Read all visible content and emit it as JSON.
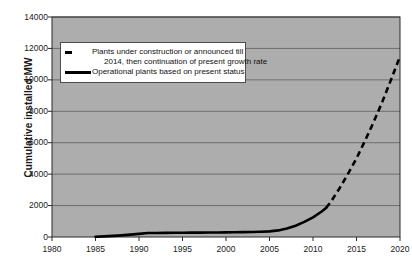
{
  "chart_data": {
    "type": "line",
    "title": "",
    "xlabel": "",
    "ylabel": "Cumulative installed MW",
    "xlim": [
      1980,
      2020
    ],
    "ylim": [
      0,
      14000
    ],
    "grid": true,
    "grid_axis": "y",
    "legend_position": "upper left",
    "x_ticks": [
      1980,
      1985,
      1990,
      1995,
      2000,
      2005,
      2010,
      2015,
      2020
    ],
    "y_ticks": [
      0,
      2000,
      4000,
      6000,
      8000,
      10000,
      12000,
      14000
    ],
    "x_tick_labels": [
      "1980",
      "1985",
      "1990",
      "1995",
      "2000",
      "2005",
      "2010",
      "2015",
      "2020"
    ],
    "y_tick_labels": [
      "0",
      "2000",
      "4000",
      "6000",
      "8000",
      "10000",
      "12000",
      "14000"
    ],
    "plot_background_color": "#adadad",
    "gridline_color": "#6e6e6e",
    "series": [
      {
        "name": "Operational plants based on present status",
        "style": "solid",
        "color": "#000000",
        "x": [
          1985,
          1986,
          1987,
          1988,
          1989,
          1990,
          1991,
          1992,
          1993,
          1994,
          1995,
          1996,
          1997,
          1998,
          1999,
          2000,
          2001,
          2002,
          2003,
          2004,
          2005,
          2006,
          2007,
          2008,
          2009,
          2010,
          2011,
          2011.5
        ],
        "values": [
          15,
          40,
          70,
          105,
          150,
          200,
          250,
          258,
          263,
          268,
          272,
          276,
          280,
          285,
          290,
          296,
          302,
          310,
          320,
          335,
          360,
          420,
          540,
          720,
          960,
          1250,
          1620,
          1850
        ]
      },
      {
        "name": "Plants under construction or announced till 2014, then continuation of present growth rate",
        "style": "dashed",
        "color": "#000000",
        "x": [
          2011.5,
          2012,
          2013,
          2014,
          2015,
          2016,
          2017,
          2018,
          2019,
          2020
        ],
        "values": [
          1850,
          2200,
          3050,
          4000,
          5000,
          6150,
          7350,
          8650,
          10050,
          11500
        ]
      }
    ]
  },
  "axes": {
    "y_title": "Cumulative installed MW"
  },
  "legend": {
    "entries": [
      {
        "sample": "dashed-line-sample",
        "line1": "Plants under construction or announced till",
        "line2": "2014, then continuation of present growth rate"
      },
      {
        "sample": "solid-line-sample",
        "line1": "Operational plants based on present status",
        "line2": ""
      }
    ]
  }
}
